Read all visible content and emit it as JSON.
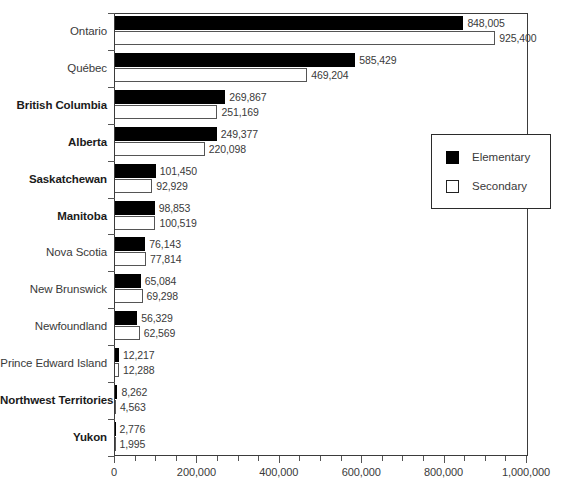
{
  "chart_data": {
    "type": "bar",
    "orientation": "horizontal",
    "title": "",
    "xlabel": "",
    "ylabel": "",
    "xlim": [
      0,
      1000000
    ],
    "grid": false,
    "legend_position": "right-middle",
    "xticks": [
      {
        "value": 0,
        "label": "0"
      },
      {
        "value": 200000,
        "label": "200,000"
      },
      {
        "value": 400000,
        "label": "400,000"
      },
      {
        "value": 600000,
        "label": "600,000"
      },
      {
        "value": 800000,
        "label": "800,000"
      },
      {
        "value": 1000000,
        "label": "1,000,000"
      }
    ],
    "minor_tick_step": 50000,
    "categories": [
      "Ontario",
      "Québec",
      "British Columbia",
      "Alberta",
      "Saskatchewan",
      "Manitoba",
      "Nova Scotia",
      "New Brunswick",
      "Newfoundland",
      "Prince Edward Island",
      "Northwest Territories",
      "Yukon"
    ],
    "category_bold": [
      false,
      false,
      true,
      true,
      true,
      true,
      false,
      false,
      false,
      false,
      true,
      true
    ],
    "series": [
      {
        "name": "Elementary",
        "color": "#000000",
        "values": [
          848005,
          585429,
          269867,
          249377,
          101450,
          98853,
          76143,
          65084,
          56329,
          12217,
          8262,
          2776
        ],
        "labels": [
          "848,005",
          "585,429",
          "269,867",
          "249,377",
          "101,450",
          "98,853",
          "76,143",
          "65,084",
          "56,329",
          "12,217",
          "8,262",
          "2,776"
        ]
      },
      {
        "name": "Secondary",
        "color": "#ffffff",
        "values": [
          925400,
          469204,
          251169,
          220098,
          92929,
          100519,
          77814,
          69298,
          62569,
          12288,
          4563,
          1995
        ],
        "labels": [
          "925,400",
          "469,204",
          "251,169",
          "220,098",
          "92,929",
          "100,519",
          "77,814",
          "69,298",
          "62,569",
          "12,288",
          "4,563",
          "1,995"
        ]
      }
    ]
  },
  "legend": {
    "items": [
      {
        "label": "Elementary",
        "swatch": "elementary"
      },
      {
        "label": "Secondary",
        "swatch": "secondary"
      }
    ]
  }
}
